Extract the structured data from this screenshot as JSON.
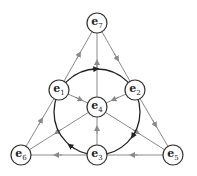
{
  "diagram": {
    "colors": {
      "line": "#8a8a8a",
      "circle": "#222222",
      "node_stroke": "#333333",
      "node_fill": "#ffffff"
    },
    "nodes": [
      {
        "id": "e7",
        "base": "e",
        "sub": "7",
        "x": 97,
        "y": 23
      },
      {
        "id": "e1",
        "base": "e",
        "sub": "1",
        "x": 59,
        "y": 90
      },
      {
        "id": "e2",
        "base": "e",
        "sub": "2",
        "x": 135,
        "y": 90
      },
      {
        "id": "e4",
        "base": "e",
        "sub": "4",
        "x": 97,
        "y": 107
      },
      {
        "id": "e6",
        "base": "e",
        "sub": "6",
        "x": 21,
        "y": 155
      },
      {
        "id": "e3",
        "base": "e",
        "sub": "3",
        "x": 97,
        "y": 155
      },
      {
        "id": "e5",
        "base": "e",
        "sub": "5",
        "x": 173,
        "y": 155
      }
    ],
    "edges": [
      {
        "from": "e6",
        "to": "e1"
      },
      {
        "from": "e1",
        "to": "e7"
      },
      {
        "from": "e7",
        "to": "e2"
      },
      {
        "from": "e2",
        "to": "e5"
      },
      {
        "from": "e5",
        "to": "e3"
      },
      {
        "from": "e3",
        "to": "e6"
      },
      {
        "from": "e3",
        "to": "e4"
      },
      {
        "from": "e4",
        "to": "e7"
      },
      {
        "from": "e1",
        "to": "e4"
      },
      {
        "from": "e4",
        "to": "e5"
      },
      {
        "from": "e2",
        "to": "e4"
      },
      {
        "from": "e4",
        "to": "e6"
      }
    ],
    "circle": {
      "through": [
        "e1",
        "e2",
        "e3"
      ],
      "direction": "clockwise",
      "cx": 97,
      "cy": 112,
      "r": 43
    }
  }
}
